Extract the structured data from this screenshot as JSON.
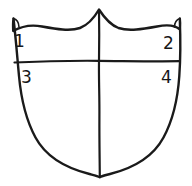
{
  "figure": {
    "shape_name": "shield",
    "stroke_color": "#1a1a1a",
    "fill_color": "#ffffff",
    "background_color": "#ffffff",
    "quadrants": [
      {
        "id": "quadrant-1",
        "label": "1",
        "position": "top-left"
      },
      {
        "id": "quadrant-2",
        "label": "2",
        "position": "top-right"
      },
      {
        "id": "quadrant-3",
        "label": "3",
        "position": "bottom-left"
      },
      {
        "id": "quadrant-4",
        "label": "4",
        "position": "bottom-right"
      }
    ],
    "dividers": [
      {
        "name": "horizontal-divider",
        "orientation": "horizontal"
      },
      {
        "name": "vertical-divider",
        "orientation": "vertical"
      }
    ]
  }
}
